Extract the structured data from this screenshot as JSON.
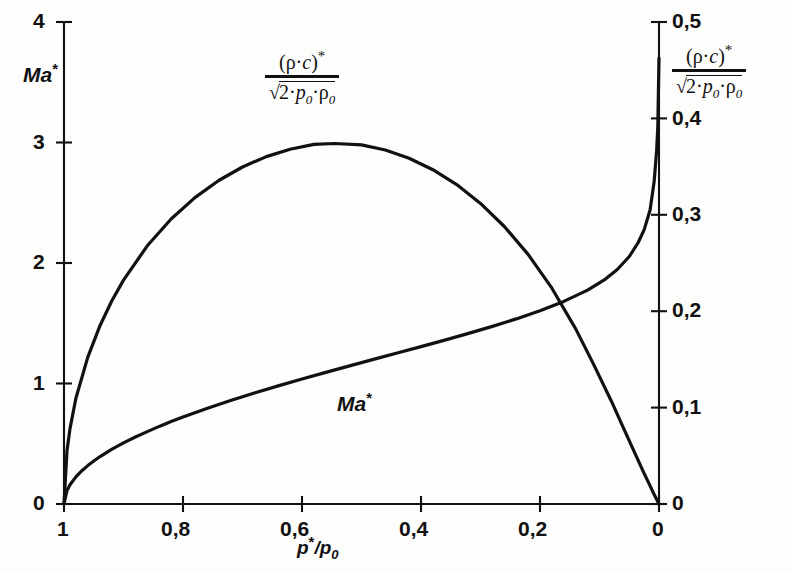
{
  "figure": {
    "background": "#fdfdfc",
    "ink_color": "#111111"
  },
  "left_axis": {
    "name": "Ma",
    "name_superscript": "*",
    "ticks": [
      "0",
      "1",
      "2",
      "3",
      "4"
    ],
    "range": [
      0,
      4
    ]
  },
  "right_axis": {
    "label": {
      "numerator_open": "(",
      "numerator_rho": "ρ",
      "numerator_dot": "·",
      "numerator_c": "c",
      "numerator_close": ")",
      "numerator_star": "*",
      "denominator_radical": "√",
      "denominator_two": "2",
      "denominator_dot1": "·",
      "denominator_p": "p",
      "denominator_p_sub": "0",
      "denominator_dot2": "·",
      "denominator_rho": "ρ",
      "denominator_rho_sub": "0"
    },
    "ticks": [
      "0",
      "0,1",
      "0,2",
      "0,3",
      "0,4",
      "0,5"
    ],
    "range": [
      0,
      0.5
    ]
  },
  "x_axis": {
    "name_p": "p",
    "name_star": "*",
    "name_slash": "/",
    "name_p2": "p",
    "name_sub": "0",
    "ticks": [
      "1",
      "0,8",
      "0,6",
      "0,4",
      "0,2",
      "0"
    ],
    "range": [
      1,
      0
    ],
    "reversed": true
  },
  "curve_labels": {
    "mach": {
      "text": "Ma",
      "star": "*"
    },
    "rhoc_inner": {
      "numerator_open": "(",
      "numerator_rho": "ρ",
      "numerator_dot": "·",
      "numerator_c": "c",
      "numerator_close": ")",
      "numerator_star": "*",
      "denominator_radical": "√",
      "denominator_two": "2",
      "denominator_dot1": "·",
      "denominator_p": "p",
      "denominator_p_sub": "0",
      "denominator_dot2": "·",
      "denominator_rho": "ρ",
      "denominator_rho_sub": "0"
    }
  },
  "chart_data": {
    "type": "line",
    "title": "",
    "xlabel": "p*/p0",
    "ylabel": "Ma*",
    "y2label": "(ρ·c)*/√(2·p0·ρ0)",
    "xlim": [
      1,
      0
    ],
    "ylim": [
      0,
      4
    ],
    "y2lim": [
      0,
      0.5
    ],
    "grid": false,
    "legend": "inline-annotations",
    "xticks": [
      1,
      0.8,
      0.6,
      0.4,
      0.2,
      0
    ],
    "yticks": [
      0,
      1,
      2,
      3,
      4
    ],
    "y2ticks": [
      0,
      0.1,
      0.2,
      0.3,
      0.4,
      0.5
    ],
    "series": [
      {
        "name": "Ma*",
        "axis": "left",
        "x": [
          1.0,
          0.995,
          0.99,
          0.98,
          0.97,
          0.96,
          0.95,
          0.94,
          0.92,
          0.9,
          0.88,
          0.86,
          0.84,
          0.82,
          0.8,
          0.76,
          0.72,
          0.68,
          0.64,
          0.6,
          0.56,
          0.52,
          0.48,
          0.44,
          0.4,
          0.36,
          0.32,
          0.28,
          0.24,
          0.2,
          0.16,
          0.12,
          0.09,
          0.07,
          0.05,
          0.035,
          0.025,
          0.015,
          0.008,
          0.004,
          0.002,
          0.0
        ],
        "y": [
          0.0,
          0.112,
          0.159,
          0.225,
          0.276,
          0.319,
          0.357,
          0.392,
          0.453,
          0.507,
          0.556,
          0.601,
          0.644,
          0.684,
          0.722,
          0.793,
          0.859,
          0.921,
          0.98,
          1.037,
          1.092,
          1.146,
          1.2,
          1.253,
          1.306,
          1.36,
          1.416,
          1.474,
          1.536,
          1.604,
          1.681,
          1.775,
          1.866,
          1.946,
          2.054,
          2.17,
          2.275,
          2.44,
          2.68,
          2.93,
          3.13,
          3.7
        ]
      },
      {
        "name": "(ρ·c)*/√(2·p0·ρ0)",
        "axis": "right",
        "x": [
          1.0,
          0.995,
          0.99,
          0.98,
          0.96,
          0.94,
          0.92,
          0.9,
          0.86,
          0.82,
          0.78,
          0.74,
          0.7,
          0.66,
          0.62,
          0.58,
          0.545,
          0.5,
          0.46,
          0.42,
          0.38,
          0.34,
          0.3,
          0.26,
          0.22,
          0.18,
          0.14,
          0.11,
          0.08,
          0.06,
          0.04,
          0.025,
          0.015,
          0.008,
          0.003,
          0.0
        ],
        "y": [
          0.0,
          0.0555,
          0.0782,
          0.1096,
          0.1524,
          0.1843,
          0.2103,
          0.2323,
          0.2678,
          0.2956,
          0.3178,
          0.3356,
          0.3496,
          0.3604,
          0.3681,
          0.373,
          0.374,
          0.3725,
          0.3672,
          0.3587,
          0.3468,
          0.3313,
          0.3118,
          0.2879,
          0.2589,
          0.2239,
          0.1816,
          0.1451,
          0.1066,
          0.0792,
          0.052,
          0.0318,
          0.0188,
          0.0098,
          0.0036,
          0.0
        ]
      }
    ],
    "annotations": [
      {
        "text": "Ma*",
        "x": 0.325,
        "y_left": 0.95,
        "note": "label on rising Mach curve"
      },
      {
        "text": "(ρ·c)*/√(2·p0·ρ0)",
        "x": 0.645,
        "y_right": 0.435,
        "note": "label under the arched mass-flux curve"
      }
    ]
  }
}
